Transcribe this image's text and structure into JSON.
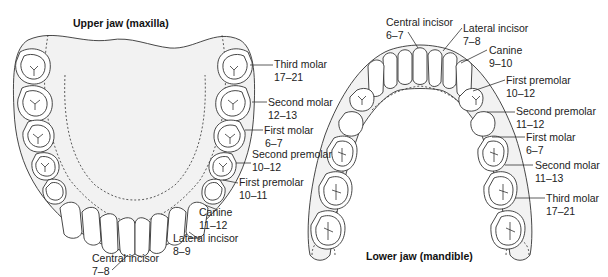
{
  "colors": {
    "outline": "#333333",
    "gum_fill": "#f2f2f2",
    "tooth_fill": "#ffffff",
    "background": "#ffffff"
  },
  "upper_jaw": {
    "title": "Upper jaw (maxilla)",
    "labels": [
      {
        "name": "Third molar",
        "age": "17–21"
      },
      {
        "name": "Second molar",
        "age": "12–13"
      },
      {
        "name": "First molar",
        "age": "6–7"
      },
      {
        "name": "Second premolar",
        "age": "10–12"
      },
      {
        "name": "First premolar",
        "age": "10–11"
      },
      {
        "name": "Canine",
        "age": "11–12"
      },
      {
        "name": "Lateral incisor",
        "age": "8–9"
      },
      {
        "name": "Central incisor",
        "age": "7–8"
      }
    ]
  },
  "lower_jaw": {
    "title": "Lower jaw (mandible)",
    "labels": [
      {
        "name": "Central incisor",
        "age": "6–7"
      },
      {
        "name": "Lateral incisor",
        "age": "7–8"
      },
      {
        "name": "Canine",
        "age": "9–10"
      },
      {
        "name": "First premolar",
        "age": "10–12"
      },
      {
        "name": "Second premolar",
        "age": "11–12"
      },
      {
        "name": "First molar",
        "age": "6–7"
      },
      {
        "name": "Second molar",
        "age": "11–13"
      },
      {
        "name": "Third molar",
        "age": "17–21"
      }
    ]
  }
}
